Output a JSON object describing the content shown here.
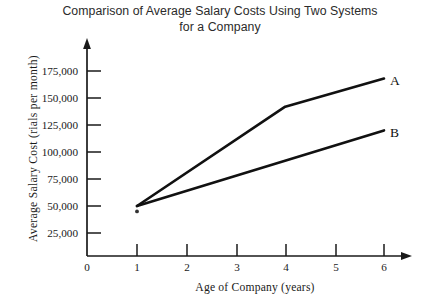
{
  "chart_data": {
    "type": "line",
    "title": "Comparison of Average Salary Costs Using Two Systems for a Company",
    "title_line1": "Comparison of Average Salary Costs Using Two Systems",
    "title_line2": "for a Company",
    "xlabel": "Age of Company (years)",
    "ylabel": "Average  Salary  Cost   (rials per month)",
    "xlim": [
      0,
      6.5
    ],
    "ylim": [
      0,
      187500
    ],
    "grid": false,
    "legend_position": "right-of-line-ends",
    "origin_label": "0",
    "x_ticks": [
      1,
      2,
      3,
      4,
      5,
      6
    ],
    "x_tick_labels": [
      "1",
      "2",
      "3",
      "4",
      "5",
      "6"
    ],
    "y_ticks": [
      25000,
      50000,
      75000,
      100000,
      125000,
      150000,
      175000
    ],
    "y_tick_labels": [
      "25,000",
      "50,000",
      "75,000",
      "100,000",
      "125,000",
      "150,000",
      "175,000"
    ],
    "annotations": [
      {
        "name": "asterisk-marker",
        "x": 1,
        "y": 45000,
        "text": "*"
      }
    ],
    "series": [
      {
        "name": "A",
        "label": "A",
        "color": "#111111",
        "x": [
          1,
          4,
          6
        ],
        "values": [
          50000,
          142000,
          168000
        ]
      },
      {
        "name": "B",
        "label": "B",
        "color": "#111111",
        "x": [
          1,
          6
        ],
        "values": [
          50000,
          120000
        ]
      }
    ]
  },
  "axes": {
    "y_arrow": "up-arrow-icon",
    "x_arrow": "right-arrow-icon"
  }
}
